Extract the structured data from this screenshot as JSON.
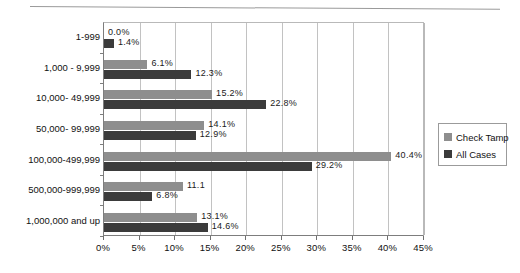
{
  "chart_data": {
    "type": "bar",
    "orientation": "horizontal",
    "title": "",
    "xlabel": "",
    "ylabel": "",
    "xlim": [
      0,
      45
    ],
    "grid": true,
    "legend_position": "right",
    "xticks": [
      "0%",
      "5%",
      "10%",
      "15%",
      "20%",
      "25%",
      "30%",
      "35%",
      "40%",
      "45%"
    ],
    "xtick_values": [
      0,
      5,
      10,
      15,
      20,
      25,
      30,
      35,
      40,
      45
    ],
    "categories": [
      "1-999",
      "1,000 - 9,999",
      "10,000- 49,999",
      "50,000- 99,999",
      "100,000-499,999",
      "500,000-999,999",
      "1,000,000 and up"
    ],
    "series": [
      {
        "name": "Check Tamp",
        "color": "#8e8e8e",
        "values": [
          0.0,
          6.1,
          15.2,
          14.1,
          40.4,
          11.1,
          13.1
        ],
        "labels": [
          "0.0%",
          "6.1%",
          "15.2%",
          "14.1%",
          "40.4%",
          "11.1",
          "13.1%"
        ]
      },
      {
        "name": "All Cases",
        "color": "#3b3b3b",
        "values": [
          1.4,
          12.3,
          22.8,
          12.9,
          29.2,
          6.8,
          14.6
        ],
        "labels": [
          "1.4%",
          "12.3%",
          "22.8%",
          "12.9%",
          "29.2%",
          "6.8%",
          "14.6%"
        ]
      }
    ]
  },
  "legend": {
    "items": [
      {
        "label": "Check Tamp",
        "swatch": "light"
      },
      {
        "label": "All Cases",
        "swatch": "dark"
      }
    ]
  }
}
